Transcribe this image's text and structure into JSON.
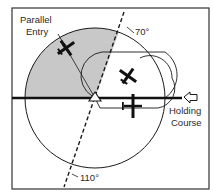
{
  "diagram": {
    "type": "holding-pattern-entry",
    "labels": {
      "entry_line1": "Parallel",
      "entry_line2": "Entry",
      "angle_top": "70°",
      "angle_bottom": "110°",
      "course_line1": "Holding",
      "course_line2": "Course"
    },
    "colors": {
      "sector_fill": "#c8c8c8",
      "line": "#1a1a1a",
      "frame": "#333333",
      "background": "#ffffff"
    }
  }
}
